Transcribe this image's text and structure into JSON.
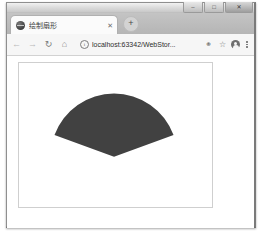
{
  "window": {
    "controls": [
      {
        "name": "minimize",
        "glyph": "–"
      },
      {
        "name": "maximize",
        "glyph": "□"
      },
      {
        "name": "close",
        "glyph": "✕"
      }
    ]
  },
  "tabstrip": {
    "tab": {
      "favicon": "globe-icon",
      "title": "绘制扇形",
      "close_glyph": "✕"
    },
    "new_tab_glyph": "+"
  },
  "toolbar": {
    "back_glyph": "←",
    "forward_glyph": "→",
    "reload_glyph": "↻",
    "home_glyph": "⌂",
    "site_info_glyph": "i",
    "url": "localhost:63342/WebStor...",
    "extensions_glyph": "⚭",
    "bookmark_glyph": "☆",
    "profile": "avatar-icon",
    "menu": "three-dot-menu-icon"
  },
  "page": {
    "canvas": {
      "width": 195,
      "height": 146,
      "border_color": "#cfcfcf",
      "background": "#ffffff",
      "shape": {
        "type": "sector",
        "fill_color": "#414141",
        "center_x": 96,
        "center_y": 95,
        "radius": 64,
        "start_angle_deg": 200,
        "end_angle_deg": 340
      }
    }
  }
}
